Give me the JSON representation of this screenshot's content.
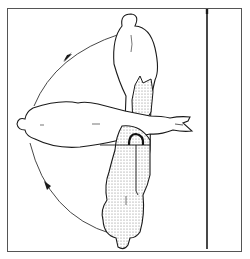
{
  "figure": {
    "colors": {
      "background": "#ffffff",
      "ink": "#1a1a1a",
      "frame": "#555555",
      "stipple": "#8a8a8a"
    },
    "positions": [
      "arm-down",
      "arm-horizontal",
      "arm-raised"
    ],
    "arrows": [
      "arrow-upper-arc",
      "arrow-lower-arc"
    ]
  }
}
